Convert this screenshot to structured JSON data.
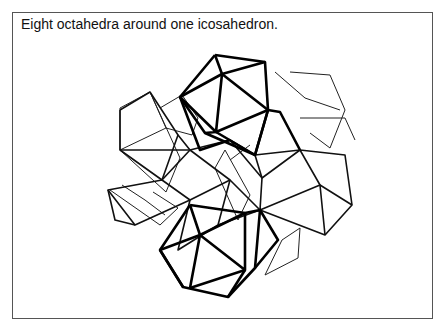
{
  "figure": {
    "caption": "Eight octahedra around one icosahedron.",
    "line_color": "#000000",
    "background": "#ffffff",
    "frame_color": "#555555"
  }
}
